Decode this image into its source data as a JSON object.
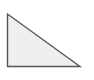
{
  "diagram": {
    "shape": "right-triangle",
    "vertices": [
      [
        7.5,
        14
      ],
      [
        7.5,
        66.5
      ],
      [
        80,
        66.5
      ]
    ],
    "fill": "#efefef",
    "stroke": "#555555",
    "stroke_width": 1.4
  }
}
